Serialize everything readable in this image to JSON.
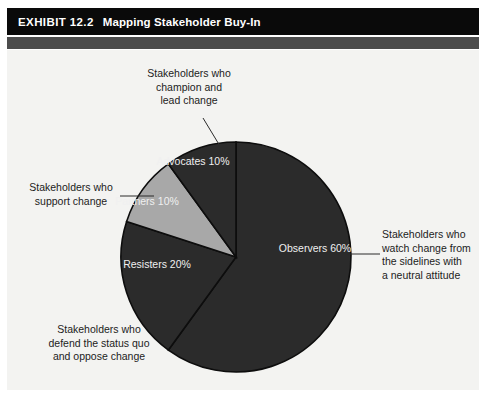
{
  "exhibit": {
    "number": "EXHIBIT 12.2",
    "title": "Mapping Stakeholder Buy-In"
  },
  "colors": {
    "title_bar": "#0a0a0a",
    "title_band": "#4d4d4d",
    "panel_background": "#f3f3f1",
    "slice_dark": "#2b2b2b",
    "slice_light": "#a8a8a8",
    "slice_outline": "#0d0d0d",
    "slice_label_text": "#f0f0f0",
    "callout_text": "#1c1c1c",
    "leader_line": "#2b2b2b"
  },
  "chart_data": {
    "type": "pie",
    "title": "Mapping Stakeholder Buy-In",
    "xlabel": "",
    "ylabel": "",
    "grid": false,
    "legend_position": "none",
    "labels_inside_slices": true,
    "start_angle_deg": 0,
    "direction": "clockwise",
    "categories": [
      "Observers",
      "Resisters",
      "Partners",
      "Advocates"
    ],
    "values": [
      60,
      20,
      10,
      10
    ],
    "slices": [
      {
        "name": "Observers",
        "value": 60,
        "label": "Observers",
        "value_label": "60%",
        "color": "#2b2b2b",
        "start_angle_deg": 0,
        "end_angle_deg": 216,
        "description": "Stakeholders who watch change from the sidelines with a neutral attitude"
      },
      {
        "name": "Resisters",
        "value": 20,
        "label": "Resisters",
        "value_label": "20%",
        "color": "#2b2b2b",
        "start_angle_deg": 216,
        "end_angle_deg": 288,
        "description": "Stakeholders who defend the status quo and oppose change"
      },
      {
        "name": "Partners",
        "value": 10,
        "label": "Partners",
        "value_label": "10%",
        "color": "#a8a8a8",
        "start_angle_deg": 288,
        "end_angle_deg": 324,
        "description": "Stakeholders who support change"
      },
      {
        "name": "Advocates",
        "value": 10,
        "label": "Advocates",
        "value_label": "10%",
        "color": "#2b2b2b",
        "start_angle_deg": 324,
        "end_angle_deg": 360,
        "description": "Stakeholders who champion and lead change"
      }
    ]
  },
  "slice_labels": {
    "observers": "Observers\n60%",
    "resisters": "Resisters\n20%",
    "partners": "Partners\n10%",
    "advocates": "Advocates\n10%"
  },
  "callouts": {
    "advocates": "Stakeholders who\nchampion and\nlead change",
    "partners": "Stakeholders who\nsupport change",
    "resisters": "Stakeholders who\ndefend the status quo\nand oppose change",
    "observers": "Stakeholders who\nwatch change from\nthe sidelines with\na neutral attitude"
  }
}
